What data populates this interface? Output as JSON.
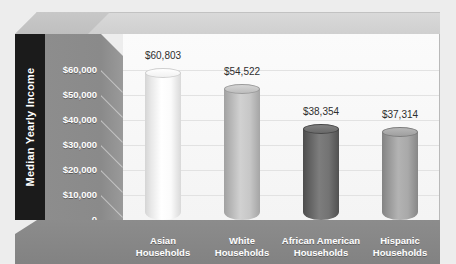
{
  "chart_data": {
    "type": "bar",
    "title": "",
    "xlabel": "",
    "ylabel": "Median Yearly Income",
    "categories": [
      "Asian\nHouseholds",
      "White\nHouseholds",
      "African American\nHouseholds",
      "Hispanic\nHouseholds"
    ],
    "category_lines": [
      [
        "Asian",
        "Households"
      ],
      [
        "White",
        "Households"
      ],
      [
        "African American",
        "Households"
      ],
      [
        "Hispanic",
        "Households"
      ]
    ],
    "values": [
      60803,
      54522,
      38354,
      37314
    ],
    "value_labels": [
      "$60,803",
      "$54,522",
      "$38,354",
      "$37,314"
    ],
    "ylim": [
      0,
      65000
    ],
    "ytick_values": [
      60000,
      50000,
      40000,
      30000,
      20000,
      10000,
      0
    ],
    "ytick_labels": [
      "$60,000",
      "$50,000",
      "$40,000",
      "$30,000",
      "$20,000",
      "$10,000",
      "0"
    ],
    "grid": true,
    "legend": "none",
    "bar_colors": [
      "#f7f7f7",
      "#c3c3c3",
      "#6f6f6f",
      "#a5a5a5"
    ],
    "bar_style": "cylinder-3d"
  },
  "colors": {
    "page_background": "#ededed",
    "plot_background": "#fafafa",
    "axis_title_band": "#1b1b1b",
    "tick_band": "#8b8b8b",
    "category_band": "#878787",
    "floor": "#b2b2b2",
    "gridline": "#e2e2e2",
    "value_label_text": "#2e2e2e",
    "tick_label_text": "#ffffff",
    "category_label_text": "#ffffff"
  }
}
